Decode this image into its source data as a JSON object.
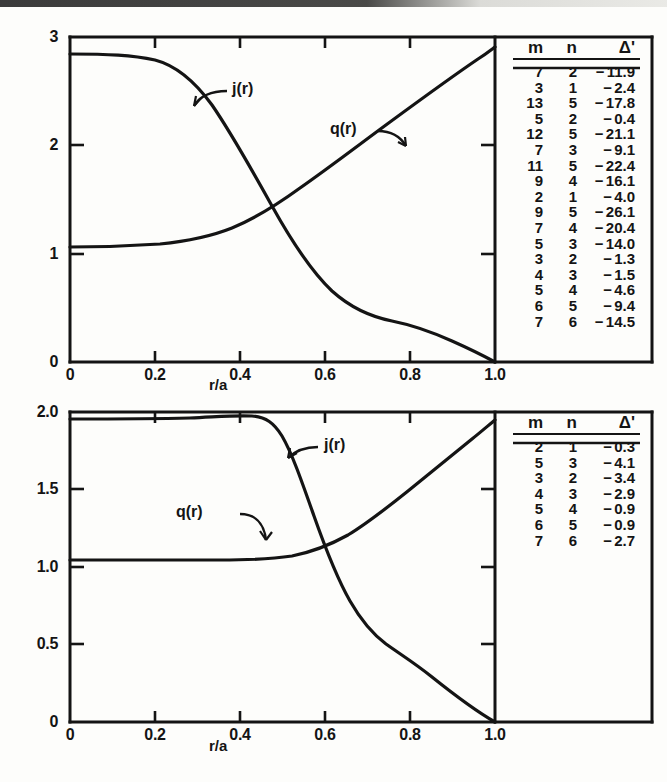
{
  "figure": {
    "panels": [
      {
        "id": "top",
        "axis": {
          "xlabel": "r/a",
          "xticks": [
            "0",
            "0.2",
            "0.4",
            "0.6",
            "0.8",
            "1.0"
          ],
          "xvalues": [
            0,
            0.2,
            0.4,
            0.6,
            0.8,
            1.0
          ],
          "yticks": [
            "0",
            "1",
            "2",
            "3"
          ],
          "yvalues": [
            0,
            1,
            2,
            3
          ],
          "xlim": [
            0,
            1.0
          ],
          "ylim": [
            0,
            3
          ]
        },
        "curves": [
          {
            "name": "j(r)",
            "label": "j(r)"
          },
          {
            "name": "q(r)",
            "label": "q(r)"
          }
        ],
        "table": {
          "headers": [
            "m",
            "n",
            "Δ'"
          ],
          "rows": [
            [
              "7",
              "2",
              "−",
              "11.9"
            ],
            [
              "3",
              "1",
              "−",
              "2.4"
            ],
            [
              "13",
              "5",
              "−",
              "17.8"
            ],
            [
              "5",
              "2",
              "−",
              "0.4"
            ],
            [
              "12",
              "5",
              "−",
              "21.1"
            ],
            [
              "7",
              "3",
              "−",
              "9.1"
            ],
            [
              "11",
              "5",
              "−",
              "22.4"
            ],
            [
              "9",
              "4",
              "−",
              "16.1"
            ],
            [
              "2",
              "1",
              "−",
              "4.0"
            ],
            [
              "9",
              "5",
              "−",
              "26.1"
            ],
            [
              "7",
              "4",
              "−",
              "20.4"
            ],
            [
              "5",
              "3",
              "−",
              "14.0"
            ],
            [
              "3",
              "2",
              "−",
              "1.3"
            ],
            [
              "4",
              "3",
              "−",
              "1.5"
            ],
            [
              "5",
              "4",
              "−",
              "4.6"
            ],
            [
              "6",
              "5",
              "−",
              "9.4"
            ],
            [
              "7",
              "6",
              "−",
              "14.5"
            ]
          ]
        }
      },
      {
        "id": "bottom",
        "axis": {
          "xlabel": "r/a",
          "xticks": [
            "0",
            "0.2",
            "0.4",
            "0.6",
            "0.8",
            "1.0"
          ],
          "xvalues": [
            0,
            0.2,
            0.4,
            0.6,
            0.8,
            1.0
          ],
          "yticks": [
            "0",
            "0.5",
            "1.0",
            "1.5",
            "2.0"
          ],
          "yvalues": [
            0,
            0.5,
            1.0,
            1.5,
            2.0
          ],
          "xlim": [
            0,
            1.0
          ],
          "ylim": [
            0,
            2.0
          ]
        },
        "curves": [
          {
            "name": "j(r)",
            "label": "j(r)"
          },
          {
            "name": "q(r)",
            "label": "q(r)"
          }
        ],
        "table": {
          "headers": [
            "m",
            "n",
            "Δ'"
          ],
          "rows": [
            [
              "2",
              "1",
              "−",
              "0.3"
            ],
            [
              "5",
              "3",
              "−",
              "4.1"
            ],
            [
              "3",
              "2",
              "−",
              "3.4"
            ],
            [
              "4",
              "3",
              "−",
              "2.9"
            ],
            [
              "5",
              "4",
              "−",
              "0.9"
            ],
            [
              "6",
              "5",
              "−",
              "0.9"
            ],
            [
              "7",
              "6",
              "−",
              "2.7"
            ]
          ]
        }
      }
    ]
  },
  "chart_data": [
    {
      "type": "line",
      "title": "",
      "xlabel": "r/a",
      "ylabel": "",
      "xlim": [
        0,
        1.0
      ],
      "ylim": [
        0,
        3
      ],
      "grid": false,
      "legend": "inline-annotation",
      "x": [
        0.0,
        0.05,
        0.1,
        0.15,
        0.2,
        0.25,
        0.3,
        0.35,
        0.4,
        0.45,
        0.5,
        0.55,
        0.6,
        0.65,
        0.7,
        0.75,
        0.8,
        0.85,
        0.9,
        0.95,
        1.0
      ],
      "series": [
        {
          "name": "j(r)",
          "values": [
            2.85,
            2.85,
            2.85,
            2.84,
            2.82,
            2.75,
            2.62,
            2.42,
            2.17,
            1.88,
            1.58,
            1.28,
            1.02,
            0.8,
            0.62,
            0.5,
            0.43,
            0.36,
            0.27,
            0.15,
            0.0
          ]
        },
        {
          "name": "q(r)",
          "values": [
            1.06,
            1.06,
            1.06,
            1.06,
            1.07,
            1.08,
            1.1,
            1.14,
            1.21,
            1.31,
            1.44,
            1.58,
            1.73,
            1.88,
            2.03,
            2.18,
            2.33,
            2.47,
            2.61,
            2.74,
            2.85
          ]
        }
      ]
    },
    {
      "type": "line",
      "title": "",
      "xlabel": "r/a",
      "ylabel": "",
      "xlim": [
        0,
        1.0
      ],
      "ylim": [
        0,
        2.0
      ],
      "grid": false,
      "legend": "inline-annotation",
      "x": [
        0.0,
        0.05,
        0.1,
        0.15,
        0.2,
        0.25,
        0.3,
        0.35,
        0.4,
        0.45,
        0.5,
        0.55,
        0.6,
        0.65,
        0.7,
        0.75,
        0.8,
        0.85,
        0.9,
        0.95,
        1.0
      ],
      "series": [
        {
          "name": "j(r)",
          "values": [
            1.89,
            1.89,
            1.89,
            1.89,
            1.89,
            1.89,
            1.9,
            1.91,
            1.93,
            1.94,
            1.9,
            1.75,
            1.5,
            1.22,
            0.98,
            0.8,
            0.66,
            0.52,
            0.38,
            0.21,
            0.0
          ]
        },
        {
          "name": "q(r)",
          "values": [
            1.05,
            1.05,
            1.05,
            1.05,
            1.05,
            1.05,
            1.05,
            1.05,
            1.05,
            1.06,
            1.07,
            1.1,
            1.15,
            1.23,
            1.33,
            1.45,
            1.58,
            1.7,
            1.81,
            1.89,
            1.94
          ]
        }
      ]
    }
  ]
}
